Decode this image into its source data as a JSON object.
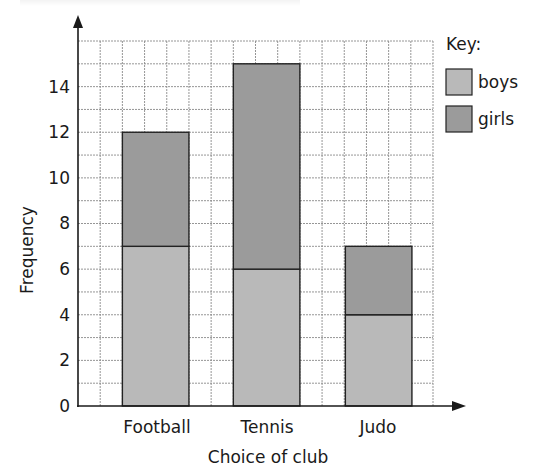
{
  "chart_data": {
    "type": "bar",
    "stacked": true,
    "title": "",
    "xlabel": "Choice of club",
    "ylabel": "Frequency",
    "categories": [
      "Football",
      "Tennis",
      "Judo"
    ],
    "series": [
      {
        "name": "boys",
        "values": [
          7,
          6,
          4
        ],
        "color": "#b9b9b9"
      },
      {
        "name": "girls",
        "values": [
          5,
          9,
          3
        ],
        "color": "#9b9b9b"
      }
    ],
    "totals": [
      12,
      15,
      7
    ],
    "ylim": [
      0,
      16
    ],
    "yticks": [
      0,
      2,
      4,
      6,
      8,
      10,
      12,
      14
    ],
    "grid": true,
    "grid_step_y": 1,
    "legend": {
      "title": "Key:",
      "position": "right-top",
      "entries": [
        "boys",
        "girls"
      ]
    }
  },
  "labels": {
    "y_axis": "Frequency",
    "x_axis": "Choice of club",
    "key_title": "Key:",
    "key_boys": "boys",
    "key_girls": "girls",
    "cat_0": "Football",
    "cat_1": "Tennis",
    "cat_2": "Judo",
    "tick_0": "0",
    "tick_2": "2",
    "tick_4": "4",
    "tick_6": "6",
    "tick_8": "8",
    "tick_10": "10",
    "tick_12": "12",
    "tick_14": "14"
  },
  "colors": {
    "boys": "#b9b9b9",
    "girls": "#9b9b9b",
    "axis": "#1a1a1a",
    "grid": "#8a8a8a"
  }
}
